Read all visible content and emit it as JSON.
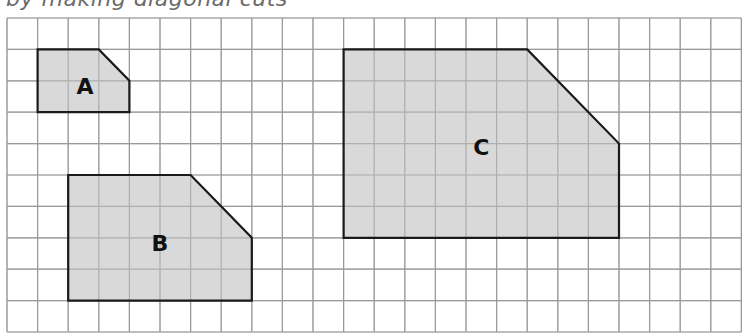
{
  "caption": "by making diagonal cuts",
  "grid": {
    "origin_x": 7,
    "origin_y": 18,
    "cell_w": 30.6,
    "cell_h": 31.4,
    "cols": 24,
    "rows": 10,
    "line_color": "#9a9a9a",
    "background": "#ffffff"
  },
  "shape_style": {
    "fill": "#d2d2d2",
    "stroke": "#1a1a1a"
  },
  "shapes": [
    {
      "label": "A",
      "points_grid": [
        [
          1,
          1
        ],
        [
          3,
          1
        ],
        [
          4,
          2
        ],
        [
          4,
          3
        ],
        [
          1,
          3
        ]
      ],
      "label_pos": [
        2.55,
        2.15
      ]
    },
    {
      "label": "B",
      "points_grid": [
        [
          2,
          5
        ],
        [
          6,
          5
        ],
        [
          8,
          7
        ],
        [
          8,
          9
        ],
        [
          2,
          9
        ]
      ],
      "label_pos": [
        5.0,
        7.15
      ]
    },
    {
      "label": "C",
      "points_grid": [
        [
          11,
          1
        ],
        [
          17,
          1
        ],
        [
          20,
          4
        ],
        [
          20,
          7
        ],
        [
          11,
          7
        ]
      ],
      "label_pos": [
        15.5,
        4.1
      ]
    }
  ]
}
